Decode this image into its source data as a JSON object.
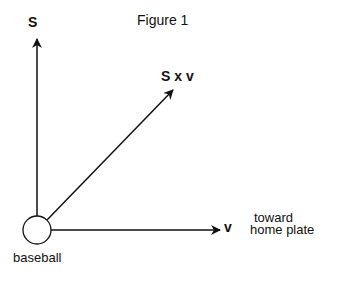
{
  "figure": {
    "title": "Figure 1",
    "labels": {
      "spin_vector": "S",
      "cross_product": "S x v",
      "velocity_vector": "v",
      "direction_line1": "toward",
      "direction_line2": "home plate",
      "object": "baseball"
    },
    "colors": {
      "stroke": "#111111",
      "background": "#ffffff"
    }
  }
}
